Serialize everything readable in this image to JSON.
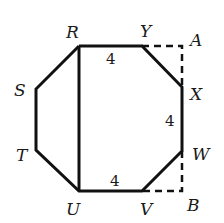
{
  "diagram": {
    "type": "octagon-in-rectangle",
    "vertices": {
      "R": {
        "label": "R",
        "x": 79,
        "y": 46
      },
      "S": {
        "label": "S",
        "x": 36,
        "y": 89
      },
      "T": {
        "label": "T",
        "x": 36,
        "y": 150
      },
      "U": {
        "label": "U",
        "x": 79,
        "y": 191
      },
      "V": {
        "label": "V",
        "x": 142,
        "y": 191
      },
      "W": {
        "label": "W",
        "x": 182,
        "y": 151
      },
      "X": {
        "label": "X",
        "x": 182,
        "y": 87
      },
      "Y": {
        "label": "Y",
        "x": 142,
        "y": 46
      },
      "A": {
        "label": "A",
        "x": 182,
        "y": 46
      },
      "B": {
        "label": "B",
        "x": 182,
        "y": 191
      }
    },
    "segment_labels": {
      "RY": "4",
      "XW": "4",
      "UV": "4"
    },
    "solid_edges": [
      "RY",
      "YX",
      "XW",
      "WV",
      "VU",
      "UT",
      "TS",
      "SR",
      "RU"
    ],
    "dashed_edges": [
      "YA",
      "AX",
      "WB",
      "BV"
    ],
    "line_color": "#111111"
  }
}
